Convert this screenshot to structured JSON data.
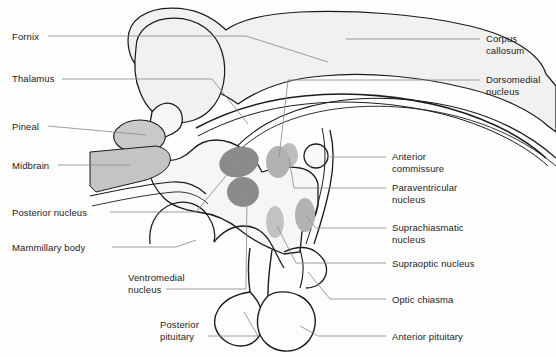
{
  "figure": {
    "width": 556,
    "height": 357,
    "background_color": "#fefefe",
    "outline_color": "#1b1b1b",
    "leader_line_color": "#8c8c8c",
    "tissue_fill": "#f1f1f1",
    "nucleus_dark_color": "#8a8a8a",
    "nucleus_light_color": "#b2b2b2",
    "pineal_color": "#c9c9c9",
    "midbrain_color": "#c4c4c4"
  },
  "labels_left": [
    {
      "id": "fornix",
      "text": "Fornix",
      "x": 12,
      "y": 31
    },
    {
      "id": "thalamus",
      "text": "Thalamus",
      "x": 12,
      "y": 73
    },
    {
      "id": "pineal",
      "text": "Pineal",
      "x": 12,
      "y": 122
    },
    {
      "id": "midbrain",
      "text": "Midbrain",
      "x": 12,
      "y": 161
    },
    {
      "id": "posterior-nucleus",
      "text": "Posterior nucleus",
      "x": 12,
      "y": 208
    },
    {
      "id": "mammillary-body",
      "text": "Mammillary body",
      "x": 12,
      "y": 243
    }
  ],
  "labels_center": [
    {
      "id": "ventromedial-nucleus",
      "text": "Ventromedial\nnucleus",
      "x": 128,
      "y": 272
    },
    {
      "id": "posterior-pituitary",
      "text": "Posterior\npituitary",
      "x": 160,
      "y": 319
    }
  ],
  "labels_right": [
    {
      "id": "corpus-callosum",
      "text": "Corpus\ncallosum",
      "x": 486,
      "y": 33
    },
    {
      "id": "dorsomedial-nucleus",
      "text": "Dorsomedial\nnucleus",
      "x": 486,
      "y": 74
    },
    {
      "id": "anterior-commissure",
      "text": "Anterior\ncommissure",
      "x": 392,
      "y": 151
    },
    {
      "id": "paraventricular-nucleus",
      "text": "Paraventricular\nnucleus",
      "x": 392,
      "y": 182
    },
    {
      "id": "suprachiasmatic-nucleus",
      "text": "Suprachiasmatic\nnucleus",
      "x": 392,
      "y": 222
    },
    {
      "id": "supraoptic-nucleus",
      "text": "Supraoptic nucleus",
      "x": 392,
      "y": 258
    },
    {
      "id": "optic-chiasma",
      "text": "Optic chiasma",
      "x": 392,
      "y": 294
    },
    {
      "id": "anterior-pituitary",
      "text": "Anterior pituitary",
      "x": 392,
      "y": 331
    }
  ],
  "structures": [
    {
      "id": "corpus-callosum-body",
      "name": "corpus callosum"
    },
    {
      "id": "thalamus-body",
      "name": "thalamus"
    },
    {
      "id": "fornix-band",
      "name": "fornix"
    },
    {
      "id": "pineal-gland",
      "name": "pineal gland"
    },
    {
      "id": "midbrain-wedge",
      "name": "midbrain"
    },
    {
      "id": "mammillary-body-lobe",
      "name": "mammillary body"
    },
    {
      "id": "anterior-commissure-circle",
      "name": "anterior commissure"
    },
    {
      "id": "optic-chiasma-lobe",
      "name": "optic chiasma"
    },
    {
      "id": "pituitary-stalk",
      "name": "infundibulum"
    },
    {
      "id": "anterior-pituitary-lobe",
      "name": "anterior pituitary"
    },
    {
      "id": "posterior-pituitary-lobe",
      "name": "posterior pituitary"
    },
    {
      "id": "nucleus-posterior",
      "name": "posterior nucleus"
    },
    {
      "id": "nucleus-ventromedial",
      "name": "ventromedial nucleus"
    },
    {
      "id": "nucleus-dorsomedial",
      "name": "dorsomedial nucleus"
    },
    {
      "id": "nucleus-paraventricular",
      "name": "paraventricular nucleus"
    },
    {
      "id": "nucleus-suprachiasmatic",
      "name": "suprachiasmatic nucleus"
    },
    {
      "id": "nucleus-supraoptic",
      "name": "supraoptic nucleus"
    }
  ]
}
